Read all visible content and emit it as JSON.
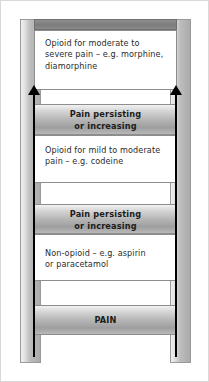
{
  "diagram": {
    "colors": {
      "rail": "#bdbdbd",
      "rung_band": "#b4b4b4",
      "arrow": "#000000",
      "text": "#2b2b2b",
      "background": "#ffffff",
      "border": "#8d8d8d"
    },
    "steps": [
      {
        "id": "step-3",
        "kind": "description",
        "lines": [
          "Opioid for moderate to",
          "severe pain – e.g. morphine,",
          "diamorphine"
        ]
      },
      {
        "id": "rung-upper",
        "kind": "rung",
        "lines": [
          "Pain persisting",
          "or increasing"
        ]
      },
      {
        "id": "step-2",
        "kind": "description",
        "lines": [
          "Opioid for mild to moderate",
          "pain – e.g. codeine"
        ]
      },
      {
        "id": "rung-lower",
        "kind": "rung",
        "lines": [
          "Pain persisting",
          "or increasing"
        ]
      },
      {
        "id": "step-1",
        "kind": "description",
        "lines": [
          "Non-opioid – e.g. aspirin",
          "or paracetamol"
        ]
      },
      {
        "id": "base",
        "kind": "rung",
        "lines": [
          "PAIN"
        ]
      }
    ],
    "arrows": [
      {
        "id": "arrow-left",
        "direction": "up"
      },
      {
        "id": "arrow-right",
        "direction": "up"
      }
    ]
  }
}
